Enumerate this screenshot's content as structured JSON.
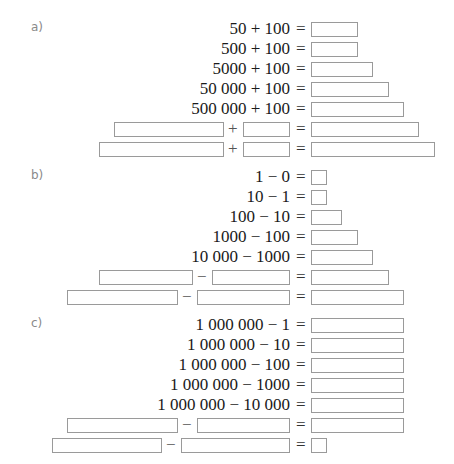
{
  "sections": [
    {
      "label": "a)",
      "rows": [
        {
          "expr": "50 + 100",
          "eq": "="
        },
        {
          "expr": "500 + 100",
          "eq": "="
        },
        {
          "expr": "5000 + 100",
          "eq": "="
        },
        {
          "expr": "50 000 + 100",
          "eq": "="
        },
        {
          "expr": "500 000 + 100",
          "eq": "="
        },
        {
          "op": "+",
          "eq": "="
        },
        {
          "op": "+",
          "eq": "="
        }
      ]
    },
    {
      "label": "b)",
      "rows": [
        {
          "expr": "1 − 0",
          "eq": "="
        },
        {
          "expr": "10 − 1",
          "eq": "="
        },
        {
          "expr": "100 − 10",
          "eq": "="
        },
        {
          "expr": "1000 − 100",
          "eq": "="
        },
        {
          "expr": "10 000 − 1000",
          "eq": "="
        },
        {
          "op": "−",
          "eq": "="
        },
        {
          "op": "−",
          "eq": "="
        }
      ]
    },
    {
      "label": "c)",
      "rows": [
        {
          "expr": "1 000 000 − 1",
          "eq": "="
        },
        {
          "expr": "1 000 000 − 10",
          "eq": "="
        },
        {
          "expr": "1 000 000 − 100",
          "eq": "="
        },
        {
          "expr": "1 000 000 − 1000",
          "eq": "="
        },
        {
          "expr": "1 000 000 − 10 000",
          "eq": "="
        },
        {
          "op": "−",
          "eq": "="
        },
        {
          "op": "−",
          "eq": "="
        }
      ]
    }
  ]
}
